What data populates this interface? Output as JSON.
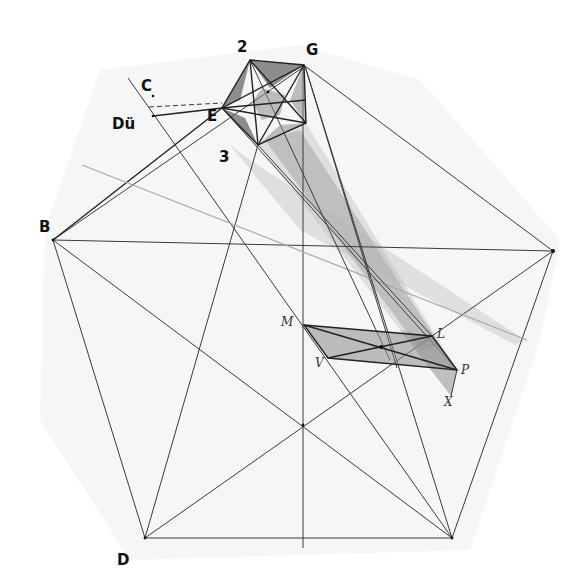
{
  "diagram": {
    "type": "geometric-construction",
    "labels": {
      "two": "2",
      "G": "G",
      "C": "C",
      "E": "E",
      "Du": "Dü",
      "three": "3",
      "B": "B",
      "D": "D",
      "M": "M",
      "L": "L",
      "V": "V",
      "P": "P",
      "X": "X"
    },
    "large_pentagon": {
      "vertices": {
        "G": [
          305,
          66
        ],
        "right": [
          553,
          251
        ],
        "bottom_right": [
          452,
          538
        ],
        "D": [
          145,
          538
        ],
        "B": [
          53,
          240
        ]
      }
    },
    "small_pentagon": {
      "vertices": {
        "2": [
          250,
          60
        ],
        "G": [
          304,
          65
        ],
        "right_bottom": [
          306,
          123
        ],
        "3": [
          258,
          145
        ],
        "E": [
          222,
          108
        ]
      }
    },
    "parallelogram": {
      "vertices": {
        "M": [
          304,
          325
        ],
        "L": [
          432,
          336
        ],
        "P": [
          457,
          370
        ],
        "V": [
          328,
          358
        ]
      },
      "X": [
        451,
        396
      ],
      "center": [
        381,
        347
      ]
    },
    "auxiliary_points": {
      "C": [
        153,
        96
      ],
      "Du": [
        153,
        116
      ],
      "vertical_axis_x": 303,
      "axis_intersection": [
        303,
        425
      ]
    }
  }
}
